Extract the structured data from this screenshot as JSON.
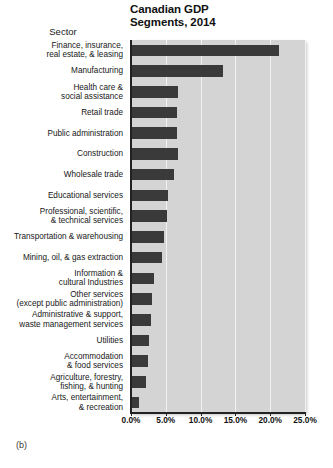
{
  "chart_data": {
    "type": "bar",
    "orientation": "horizontal",
    "title": "Canadian GDP Segments, 2014",
    "title_lines": [
      "Canadian GDP",
      "Segments, 2014"
    ],
    "xlabel": "",
    "ylabel": "Sector",
    "xlim": [
      0,
      25
    ],
    "xtick_labels": [
      "0.0%",
      "5.0%",
      "10.0%",
      "15.0%",
      "20.0%",
      "25.0%"
    ],
    "xticks": [
      0,
      5,
      10,
      15,
      20,
      25
    ],
    "grid": "vertical",
    "legend": "none",
    "units": "percent",
    "categories": [
      "Finance, insurance, real estate, & leasing",
      "Manufacturing",
      "Health care & social assistance",
      "Retail trade",
      "Public administration",
      "Construction",
      "Wholesale trade",
      "Educational services",
      "Professional, scientific, & technical services",
      "Transportation & warehousing",
      "Mining, oil, & gas extraction",
      "Information & cultural Industries",
      "Other services (except public administration)",
      "Administrative & support, waste management services",
      "Utilities",
      "Accommodation & food services",
      "Agriculture, forestry, fishing, & hunting",
      "Arts, entertainment, & recreation"
    ],
    "category_lines": [
      [
        "Finance, insurance,",
        "real estate, & leasing"
      ],
      [
        "Manufacturing"
      ],
      [
        "Health care &",
        "social assistance"
      ],
      [
        "Retail trade"
      ],
      [
        "Public administration"
      ],
      [
        "Construction"
      ],
      [
        "Wholesale trade"
      ],
      [
        "Educational services"
      ],
      [
        "Professional, scientific,",
        "& technical services"
      ],
      [
        "Transportation & warehousing"
      ],
      [
        "Mining, oil, & gas extraction"
      ],
      [
        "Information &",
        "cultural Industries"
      ],
      [
        "Other services",
        "(except public administration)"
      ],
      [
        "Administrative & support,",
        "waste management services"
      ],
      [
        "Utilities"
      ],
      [
        "Accommodation",
        "& food services"
      ],
      [
        "Agriculture, forestry,",
        "fishing, & hunting"
      ],
      [
        "Arts, entertainment,",
        "& recreation"
      ]
    ],
    "values": [
      21.3,
      13.2,
      6.8,
      6.6,
      6.6,
      6.7,
      6.2,
      5.3,
      5.2,
      4.7,
      4.4,
      3.3,
      3.0,
      2.9,
      2.6,
      2.4,
      2.1,
      1.2
    ],
    "bar_color": "#3a3a3a",
    "plot_background": "#d4d4d4",
    "gridline_color": "#f2f2f2"
  },
  "caption": {
    "label": "(b)"
  }
}
